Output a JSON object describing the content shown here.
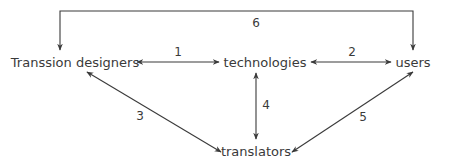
{
  "nodes": {
    "designers": "Transsion designers",
    "technologies": "technologies",
    "users": "users",
    "translators": "translators"
  },
  "edges": [
    {
      "id": 1,
      "label": "1",
      "from": "Transsion designers",
      "to": "technologies",
      "direction": "both"
    },
    {
      "id": 2,
      "label": "2",
      "from": "technologies",
      "to": "users",
      "direction": "both"
    },
    {
      "id": 3,
      "label": "3",
      "from": "translators",
      "to": "Transsion designers",
      "direction": "both"
    },
    {
      "id": 4,
      "label": "4",
      "from": "technologies",
      "to": "translators",
      "direction": "both"
    },
    {
      "id": 5,
      "label": "5",
      "from": "translators",
      "to": "users",
      "direction": "both"
    },
    {
      "id": 6,
      "label": "6",
      "from": "Transsion designers",
      "to": "users",
      "direction": "both"
    }
  ],
  "colors": {
    "line": "#3a3a3a",
    "text": "#3a3a3a",
    "background": "#ffffff"
  }
}
